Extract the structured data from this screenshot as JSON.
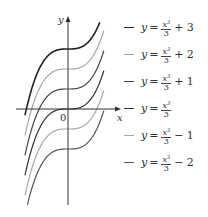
{
  "chart_data": {
    "type": "line",
    "title": "",
    "xlabel": "x",
    "ylabel": "y",
    "origin_label": "0",
    "function_family": "y = x^3/3 + C",
    "x_range": [
      -2.15,
      1.8
    ],
    "grid": false,
    "legend_position": "right",
    "series": [
      {
        "name": "y = x³/3 + 3",
        "C": 3,
        "color": "#222222",
        "legend": {
          "lhs": "y",
          "num": "x",
          "exp": "3",
          "den": "3",
          "tail": "+ 3"
        }
      },
      {
        "name": "y = x³/3 + 2",
        "C": 2,
        "color": "#a8a8a8",
        "legend": {
          "lhs": "y",
          "num": "x",
          "exp": "3",
          "den": "3",
          "tail": "+ 2"
        }
      },
      {
        "name": "y = x³/3 + 1",
        "C": 1,
        "color": "#444444",
        "legend": {
          "lhs": "y",
          "num": "x",
          "exp": "3",
          "den": "3",
          "tail": "+ 1"
        }
      },
      {
        "name": "y = x³/3",
        "C": 0,
        "color": "#333333",
        "legend": {
          "lhs": "y",
          "num": "x",
          "exp": "3",
          "den": "3",
          "tail": ""
        }
      },
      {
        "name": "y = x³/3 − 1",
        "C": -1,
        "color": "#a8a8a8",
        "legend": {
          "lhs": "y",
          "num": "x",
          "exp": "3",
          "den": "3",
          "tail": "− 1"
        }
      },
      {
        "name": "y = x³/3 − 2",
        "C": -2,
        "color": "#555555",
        "legend": {
          "lhs": "y",
          "num": "x",
          "exp": "3",
          "den": "3",
          "tail": "− 2"
        }
      }
    ]
  },
  "axes": {
    "origin_px": [
      68,
      109
    ],
    "scale_px_per_unit": 20,
    "x_axis": {
      "from": 16,
      "to": 121
    },
    "y_axis": {
      "from": 205,
      "to": 16
    },
    "plot_clip": {
      "top": 22,
      "bottom": 205
    }
  }
}
